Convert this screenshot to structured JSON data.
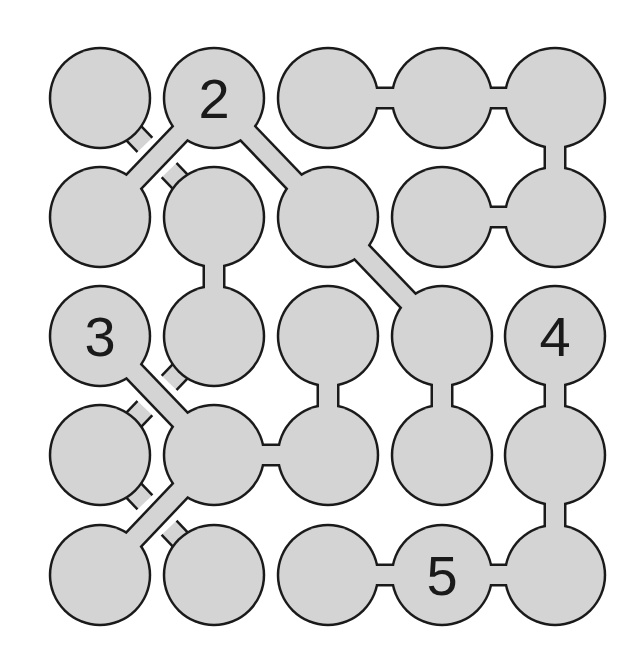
{
  "puzzle": {
    "type": "connection-puzzle",
    "rows": 5,
    "cols": 5,
    "colors": {
      "background": "#ffffff",
      "node_fill": "#d4d4d4",
      "stroke": "#1a1a1a",
      "text": "#1a1a1a"
    },
    "geometry": {
      "col_x": [
        100,
        214,
        328,
        442,
        555
      ],
      "row_y": [
        98,
        217,
        336,
        455,
        575
      ],
      "radius": 50,
      "link_width": 18,
      "stroke_width": 2.5
    },
    "nodes": [
      {
        "id": "r0c0",
        "row": 0,
        "col": 0,
        "label": ""
      },
      {
        "id": "r0c1",
        "row": 0,
        "col": 1,
        "label": "2"
      },
      {
        "id": "r0c2",
        "row": 0,
        "col": 2,
        "label": ""
      },
      {
        "id": "r0c3",
        "row": 0,
        "col": 3,
        "label": ""
      },
      {
        "id": "r0c4",
        "row": 0,
        "col": 4,
        "label": ""
      },
      {
        "id": "r1c0",
        "row": 1,
        "col": 0,
        "label": ""
      },
      {
        "id": "r1c1",
        "row": 1,
        "col": 1,
        "label": ""
      },
      {
        "id": "r1c2",
        "row": 1,
        "col": 2,
        "label": ""
      },
      {
        "id": "r1c3",
        "row": 1,
        "col": 3,
        "label": ""
      },
      {
        "id": "r1c4",
        "row": 1,
        "col": 4,
        "label": ""
      },
      {
        "id": "r2c0",
        "row": 2,
        "col": 0,
        "label": "3"
      },
      {
        "id": "r2c1",
        "row": 2,
        "col": 1,
        "label": ""
      },
      {
        "id": "r2c2",
        "row": 2,
        "col": 2,
        "label": ""
      },
      {
        "id": "r2c3",
        "row": 2,
        "col": 3,
        "label": ""
      },
      {
        "id": "r2c4",
        "row": 2,
        "col": 4,
        "label": "4"
      },
      {
        "id": "r3c0",
        "row": 3,
        "col": 0,
        "label": ""
      },
      {
        "id": "r3c1",
        "row": 3,
        "col": 1,
        "label": ""
      },
      {
        "id": "r3c2",
        "row": 3,
        "col": 2,
        "label": ""
      },
      {
        "id": "r3c3",
        "row": 3,
        "col": 3,
        "label": ""
      },
      {
        "id": "r3c4",
        "row": 3,
        "col": 4,
        "label": ""
      },
      {
        "id": "r4c0",
        "row": 4,
        "col": 0,
        "label": ""
      },
      {
        "id": "r4c1",
        "row": 4,
        "col": 1,
        "label": ""
      },
      {
        "id": "r4c2",
        "row": 4,
        "col": 2,
        "label": ""
      },
      {
        "id": "r4c3",
        "row": 4,
        "col": 3,
        "label": "5"
      },
      {
        "id": "r4c4",
        "row": 4,
        "col": 4,
        "label": ""
      }
    ],
    "links": [
      {
        "from": "r0c2",
        "to": "r0c3",
        "kind": "horizontal",
        "layer": "over"
      },
      {
        "from": "r0c3",
        "to": "r0c4",
        "kind": "horizontal",
        "layer": "over"
      },
      {
        "from": "r1c3",
        "to": "r1c4",
        "kind": "horizontal",
        "layer": "over"
      },
      {
        "from": "r3c1",
        "to": "r3c2",
        "kind": "horizontal",
        "layer": "over"
      },
      {
        "from": "r4c2",
        "to": "r4c3",
        "kind": "horizontal",
        "layer": "over"
      },
      {
        "from": "r4c3",
        "to": "r4c4",
        "kind": "horizontal",
        "layer": "over"
      },
      {
        "from": "r0c4",
        "to": "r1c4",
        "kind": "vertical",
        "layer": "over"
      },
      {
        "from": "r1c1",
        "to": "r2c1",
        "kind": "vertical",
        "layer": "over"
      },
      {
        "from": "r2c2",
        "to": "r3c2",
        "kind": "vertical",
        "layer": "over"
      },
      {
        "from": "r2c3",
        "to": "r3c3",
        "kind": "vertical",
        "layer": "over"
      },
      {
        "from": "r2c4",
        "to": "r3c4",
        "kind": "vertical",
        "layer": "over"
      },
      {
        "from": "r3c4",
        "to": "r4c4",
        "kind": "vertical",
        "layer": "over"
      },
      {
        "from": "r0c1",
        "to": "r1c0",
        "kind": "diagonal",
        "layer": "over"
      },
      {
        "from": "r0c1",
        "to": "r1c2",
        "kind": "diagonal",
        "layer": "over"
      },
      {
        "from": "r1c2",
        "to": "r2c3",
        "kind": "diagonal",
        "layer": "over"
      },
      {
        "from": "r2c0",
        "to": "r3c1",
        "kind": "diagonal",
        "layer": "over"
      },
      {
        "from": "r3c1",
        "to": "r4c0",
        "kind": "diagonal",
        "layer": "over"
      },
      {
        "from": "r0c0",
        "to": "r1c1",
        "kind": "diagonal",
        "layer": "under"
      },
      {
        "from": "r2c1",
        "to": "r3c0",
        "kind": "diagonal",
        "layer": "under"
      },
      {
        "from": "r3c0",
        "to": "r4c1",
        "kind": "diagonal",
        "layer": "under"
      }
    ]
  }
}
